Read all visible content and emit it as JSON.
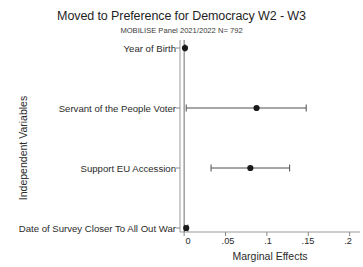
{
  "chart_data": {
    "type": "scatter",
    "title": "Moved to Preference for Democracy W2 - W3",
    "subtitle": "MOBILISE Panel 2021/2022 N= 792",
    "xlabel": "Marginal Effects",
    "ylabel": "Independent Variables",
    "xlim": [
      -0.005,
      0.2125
    ],
    "xticks": [
      0,
      0.05,
      0.1,
      0.15,
      0.2
    ],
    "xtick_labels": [
      "0",
      ".05",
      ".1",
      ".15",
      ".2"
    ],
    "grid": false,
    "legend": "none",
    "zero_reference_line": 0,
    "categories": [
      "Year of Birth",
      "Servant of the People Voter",
      "Support EU Accession",
      "Date of Survey Closer To All Out War"
    ],
    "values": [
      0.001,
      0.0875,
      0.08,
      0.0025
    ],
    "ci_low": [
      0.0005,
      0.0025,
      0.0325,
      0.0005
    ],
    "ci_high": [
      0.0015,
      0.1475,
      0.1275,
      0.0045
    ],
    "marker": "filled-circle",
    "marker_color": "#1a1a1a",
    "line_color": "#4d4d4d"
  },
  "axis": {
    "tick_color": "#8a8a8a",
    "spine_color": "#9a9a9a"
  }
}
